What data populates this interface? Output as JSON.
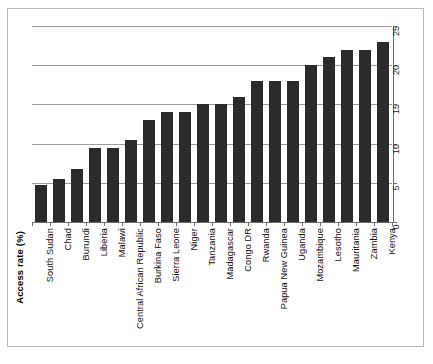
{
  "chart_data": {
    "type": "bar",
    "title": "",
    "xlabel": "",
    "ylabel": "Access rate (%)",
    "ylim": [
      0,
      25
    ],
    "yticks": [
      "0",
      "5",
      "10",
      "15",
      "20",
      "25"
    ],
    "grid": true,
    "legend": "none",
    "orientation": "vertical",
    "bar_color": "#2b2b2b",
    "categories": [
      "South Sudan",
      "Chad",
      "Burundi",
      "Liberia",
      "Malawi",
      "Central African Republic",
      "Burkina Faso",
      "Sierra Leone",
      "Niger",
      "Tanzania",
      "Madagascar",
      "Congo DR",
      "Rwanda",
      "Papua New Guinea",
      "Uganda",
      "Mozambique",
      "Lesotho",
      "Mauritania",
      "Zambia",
      "Kenya"
    ],
    "values": [
      4.7,
      5.5,
      6.7,
      9.5,
      9.5,
      10.5,
      13,
      14,
      14,
      15,
      15,
      16,
      18,
      18,
      18,
      20,
      21,
      22,
      22,
      23
    ]
  },
  "frame": {
    "border_color": "#b9b9b9"
  }
}
